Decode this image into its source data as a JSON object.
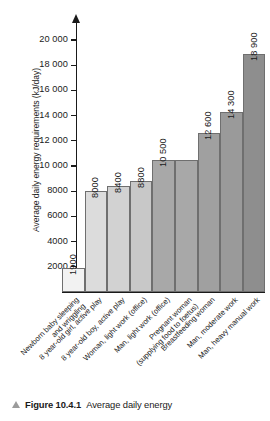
{
  "chart_data": {
    "type": "bar",
    "title": "",
    "xlabel": "",
    "ylabel": "Average daily energy requirements (kJ/day)",
    "ylim": [
      0,
      21000
    ],
    "grid": false,
    "legend": null,
    "ytick_labels": [
      "20 000",
      "18 000",
      "16 000",
      "14 000",
      "12 000",
      "10 000",
      "8000",
      "6000",
      "4000",
      "2000"
    ],
    "ytick_values": [
      20000,
      18000,
      16000,
      14000,
      12000,
      10000,
      8000,
      6000,
      4000,
      2000
    ],
    "categories": [
      "Newborn baby sleeping and wriggling",
      "8 year-old girl, active play",
      "8 year-old boy, active play",
      "Woman, light work (office)",
      "Man, light work (office)",
      "Pregnant woman (supplying food to foetus)",
      "Breastfeeding woman",
      "Man, moderate work",
      "Man, heavy manual work"
    ],
    "category_lines": [
      [
        "Newborn baby sleeping",
        "and wriggling"
      ],
      [
        "8 year-old girl, active play",
        ""
      ],
      [
        "8 year-old boy, active play",
        ""
      ],
      [
        "Woman, light work (office)",
        ""
      ],
      [
        "Man, light work (office)",
        ""
      ],
      [
        "Pregnant woman",
        "(supplying food to foetus)"
      ],
      [
        "Breastfeeding woman",
        ""
      ],
      [
        "Man, moderate work",
        ""
      ],
      [
        "Man, heavy manual work",
        ""
      ]
    ],
    "values": [
      1900,
      8000,
      8400,
      8800,
      10500,
      10500,
      12600,
      14300,
      18900
    ],
    "value_labels": [
      "1900",
      "8000",
      "8400",
      "8800",
      "10 500",
      "",
      "12 600",
      "14 300",
      "18 900"
    ],
    "bar_colors": [
      "#f2f2f2",
      "#dcdcdc",
      "#d2d2d2",
      "#c8c8c8",
      "#a8a8a8",
      "#a8a8a8",
      "#a0a0a0",
      "#9a9a9a",
      "#8e8e8e"
    ],
    "bar_border_color": "#6f6f6f"
  },
  "caption": {
    "marker": "triangle-up-icon",
    "figure_number": "Figure 10.4.1",
    "text": "Average daily energy"
  }
}
